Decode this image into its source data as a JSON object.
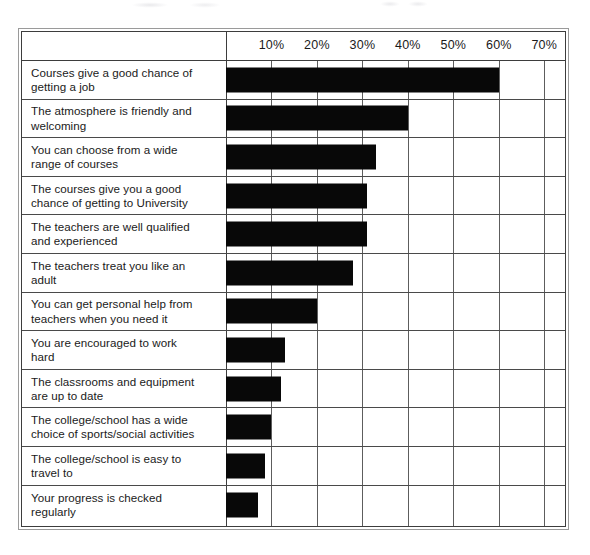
{
  "chart_data": {
    "type": "bar",
    "orientation": "horizontal",
    "title": "",
    "xlabel": "",
    "ylabel": "",
    "xlim": [
      0,
      75
    ],
    "grid": true,
    "legend": null,
    "axis_ticks": [
      "10%",
      "20%",
      "30%",
      "40%",
      "50%",
      "60%",
      "70%"
    ],
    "axis_tick_values": [
      10,
      20,
      30,
      40,
      50,
      60,
      70
    ],
    "categories": [
      "Courses give a good chance of getting a job",
      "The atmosphere is friendly and welcoming",
      "You can choose from a wide range of courses",
      "The courses give you a good chance of getting to University",
      "The teachers are well qualified and experienced",
      "The teachers treat you like an adult",
      "You can get personal help from teachers when you need it",
      "You are encouraged to work hard",
      "The classrooms and equipment are up to date",
      "The college/school has a wide choice of sports/social activities",
      "The college/school is easy to travel to",
      "Your progress is checked regularly"
    ],
    "values": [
      60,
      40,
      33,
      31,
      31,
      28,
      20,
      13,
      12,
      10,
      8.5,
      7
    ],
    "bar_color": "#080808"
  },
  "rows": [
    {
      "label_line1": "Courses give a good chance of",
      "label_line2": "getting a job",
      "value": 60
    },
    {
      "label_line1": "The atmosphere is friendly and",
      "label_line2": "welcoming",
      "value": 40
    },
    {
      "label_line1": "You can choose from a wide",
      "label_line2": "range of courses",
      "value": 33
    },
    {
      "label_line1": "The courses give you a good",
      "label_line2": "chance of getting to University",
      "value": 31
    },
    {
      "label_line1": "The teachers are well qualified",
      "label_line2": "and experienced",
      "value": 31
    },
    {
      "label_line1": "The teachers treat you like an",
      "label_line2": "adult",
      "value": 28
    },
    {
      "label_line1": "You can get personal help from",
      "label_line2": "teachers when you need it",
      "value": 20
    },
    {
      "label_line1": "You are encouraged to work",
      "label_line2": "hard",
      "value": 13
    },
    {
      "label_line1": "The classrooms and equipment",
      "label_line2": "are up to date",
      "value": 12
    },
    {
      "label_line1": "The college/school has a wide",
      "label_line2": "choice of sports/social activities",
      "value": 10
    },
    {
      "label_line1": "The college/school is easy to",
      "label_line2": "travel to",
      "value": 8.5
    },
    {
      "label_line1": "Your progress is checked",
      "label_line2": "regularly",
      "value": 7
    }
  ],
  "axis": {
    "ticks": [
      {
        "label": "10%",
        "value": 10
      },
      {
        "label": "20%",
        "value": 20
      },
      {
        "label": "30%",
        "value": 30
      },
      {
        "label": "40%",
        "value": 40
      },
      {
        "label": "50%",
        "value": 50
      },
      {
        "label": "60%",
        "value": 60
      },
      {
        "label": "70%",
        "value": 70
      }
    ]
  },
  "layout": {
    "label_column_width": 204,
    "plot_left": 204,
    "plot_right": 545,
    "axis_min": 0,
    "axis_max": 75,
    "row_height": 38.6
  }
}
